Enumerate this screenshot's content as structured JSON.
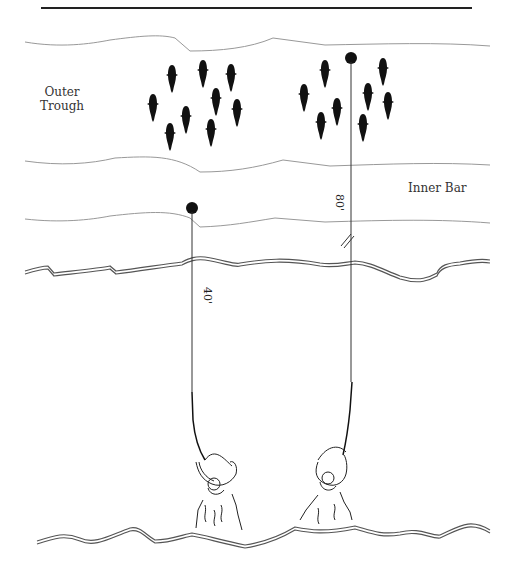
{
  "diagram": {
    "type": "surf-casting distance illustration",
    "zones": {
      "outer_trough": {
        "line1": "Outer",
        "line2": "Trough"
      },
      "inner_bar": "Inner Bar"
    },
    "casts": [
      {
        "name": "short-cast",
        "distance": "40'"
      },
      {
        "name": "long-cast",
        "distance": "80'"
      }
    ],
    "fish_schools": [
      {
        "name": "school-left",
        "count": 10
      },
      {
        "name": "school-right",
        "count": 9
      }
    ],
    "colors": {
      "ink": "#111111",
      "wave_line": "#888888",
      "background": "#ffffff"
    }
  }
}
